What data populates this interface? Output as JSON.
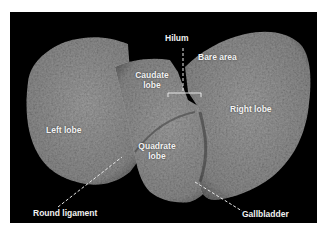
{
  "image": {
    "subject": "Liver specimen, inferior (visceral) view",
    "background_color": "#000000",
    "tissue_color": "#8a8a8a"
  },
  "labels": {
    "hilum": "Hilum",
    "bare_area": "Bare area",
    "caudate_lobe_1": "Caudate",
    "caudate_lobe_2": "lobe",
    "left_lobe": "Left lobe",
    "right_lobe": "Right lobe",
    "quadrate_lobe_1": "Quadrate",
    "quadrate_lobe_2": "lobe",
    "round_ligament": "Round ligament",
    "gallbladder": "Gallbladder"
  }
}
